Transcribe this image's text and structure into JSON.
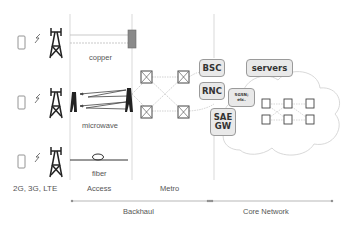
{
  "diagram": {
    "column_labels": {
      "devices": "2G, 3G, LTE",
      "access": "Access",
      "metro": "Metro"
    },
    "link_labels": {
      "copper": "copper",
      "microwave": "microwave",
      "fiber": "fiber"
    },
    "controllers": {
      "bsc": "BSC",
      "rnc": "RNC",
      "sae_gw_line1": "SAE",
      "sae_gw_line2": "GW",
      "sgsn_line1": "SGSN;",
      "sgsn_line2": "etc."
    },
    "core": {
      "servers": "servers"
    },
    "spans": {
      "backhaul": "Backhaul",
      "core_network": "Core Network"
    },
    "colors": {
      "line": "#999999",
      "box_fill": "#e9e9e9",
      "box_border": "#9a9a9a",
      "copper_block": "#8a8a8a",
      "tower": "#222222"
    }
  }
}
